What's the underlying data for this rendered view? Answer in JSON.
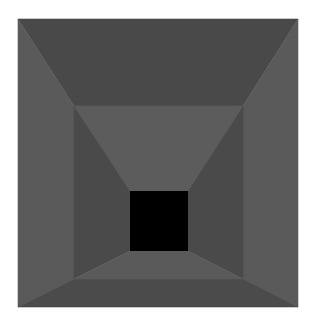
{
  "artwork": {
    "background": "#ffffff",
    "width": 318,
    "height": 326,
    "outer_square": {
      "x1": 18,
      "y1": 19,
      "x2": 298,
      "y2": 307
    },
    "middle_square": {
      "x1": 74,
      "y1": 106,
      "x2": 243,
      "y2": 279
    },
    "center_square": {
      "x1": 130,
      "y1": 191,
      "x2": 188,
      "y2": 251,
      "color": "#000000"
    },
    "outer_band_colors": {
      "top": "#494949",
      "left": "#5a5a5a",
      "right": "#5a5a5a",
      "bottom": "#4b4b4b"
    },
    "inner_band_colors": {
      "top": "#5c5c5c",
      "left": "#4a4a4a",
      "right": "#4a4a4a",
      "bottom": "#5a5a5a"
    }
  }
}
